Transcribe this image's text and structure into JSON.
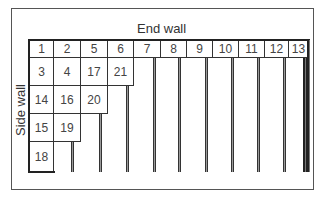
{
  "diagram": {
    "labels": {
      "end_wall": "End wall",
      "side_wall": "Side wall"
    },
    "header_row": [
      "1",
      "2",
      "5",
      "6",
      "7",
      "8",
      "9",
      "10",
      "11",
      "12",
      "13"
    ],
    "rows": [
      [
        "3",
        "4",
        "17",
        "21"
      ],
      [
        "14",
        "16",
        "20"
      ],
      [
        "15",
        "19"
      ],
      [
        "18"
      ]
    ],
    "colors": {
      "line": "#333333",
      "strip_fill": "#9a9a9a",
      "background": "#ffffff"
    }
  }
}
